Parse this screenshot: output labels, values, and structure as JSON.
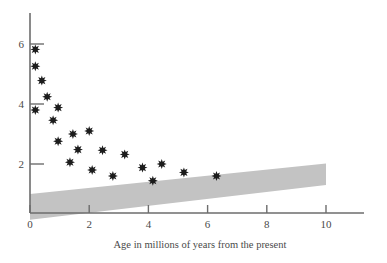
{
  "chart": {
    "type": "scatter",
    "title": "",
    "xlabel": "Age in millions of years from the present",
    "ylabel": "",
    "xlim": [
      0,
      11.7
    ],
    "ylim": [
      0,
      7.1
    ],
    "grid": false,
    "legend": null,
    "xticks": [
      0,
      2,
      4,
      6,
      8,
      10
    ],
    "xtick_labels": [
      "0",
      "2",
      "4",
      "6",
      "8",
      "10"
    ],
    "yticks": [
      2,
      4,
      6
    ],
    "ytick_labels": [
      "2",
      "4",
      "6"
    ],
    "marker_style": "asterisk-star",
    "marker_color": "#1c1c1c",
    "band_color": "#c3c3c3"
  },
  "chart_data": {
    "type": "scatter",
    "title": "",
    "xlabel": "Age in millions of years from the present",
    "ylabel": "",
    "xlim": [
      0,
      11.7
    ],
    "ylim": [
      0,
      7.1
    ],
    "grid": false,
    "legend_position": "none",
    "xticks": [
      0,
      2,
      4,
      6,
      8,
      10
    ],
    "yticks": [
      2,
      4,
      6
    ],
    "series": [
      {
        "name": "observations",
        "marker": "asterisk-star",
        "color": "#1c1c1c",
        "points": [
          {
            "x": 0.18,
            "y": 5.82
          },
          {
            "x": 0.18,
            "y": 5.26
          },
          {
            "x": 0.4,
            "y": 4.78
          },
          {
            "x": 0.58,
            "y": 4.24
          },
          {
            "x": 0.18,
            "y": 3.8
          },
          {
            "x": 0.95,
            "y": 3.88
          },
          {
            "x": 0.78,
            "y": 3.46
          },
          {
            "x": 1.45,
            "y": 3.0
          },
          {
            "x": 0.95,
            "y": 2.76
          },
          {
            "x": 2.0,
            "y": 3.1
          },
          {
            "x": 1.62,
            "y": 2.48
          },
          {
            "x": 2.45,
            "y": 2.46
          },
          {
            "x": 1.35,
            "y": 2.06
          },
          {
            "x": 3.2,
            "y": 2.32
          },
          {
            "x": 2.1,
            "y": 1.8
          },
          {
            "x": 3.8,
            "y": 1.88
          },
          {
            "x": 2.8,
            "y": 1.6
          },
          {
            "x": 4.45,
            "y": 2.0
          },
          {
            "x": 5.2,
            "y": 1.72
          },
          {
            "x": 4.15,
            "y": 1.44
          },
          {
            "x": 6.3,
            "y": 1.6
          }
        ]
      }
    ],
    "band": {
      "name": "shaded-wedge",
      "color": "#c3c3c3",
      "x_start": 0.0,
      "x_end": 10.0,
      "y_top_start": 1.0,
      "y_bottom_start": 0.14,
      "y_top_end": 2.02,
      "y_bottom_end": 1.3
    }
  }
}
